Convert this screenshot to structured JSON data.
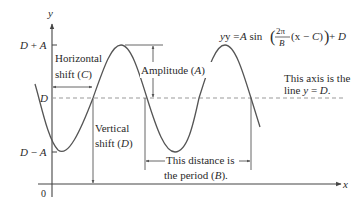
{
  "diagram": {
    "colors": {
      "curve": "#555555",
      "axis": "#444444",
      "dashed_midline": "#999999",
      "annotation": "#555555",
      "text": "#2a2a2a"
    },
    "axes": {
      "x_label": "x",
      "y_label": "y",
      "origin_label": "0"
    },
    "y_ticks": {
      "max_label_main": "D",
      "max_label_op": " + ",
      "max_label_var": "A",
      "mid_label": "D",
      "min_label_main": "D",
      "min_label_op": " − ",
      "min_label_var": "A"
    },
    "equation": {
      "lhs": "y = ",
      "amp": "A",
      "fn": " sin",
      "frac_num": "2π",
      "frac_den": "B",
      "arg_open": "(x − ",
      "arg_c": "C",
      "arg_close": ")",
      "plus": " + ",
      "d": "D"
    },
    "annotations": {
      "horizontal_shift_line1": "Horizontal",
      "horizontal_shift_line2_pre": "shift (",
      "horizontal_shift_var": "C",
      "horizontal_shift_line2_post": ")",
      "amplitude_pre": "Amplitude (",
      "amplitude_var": "A",
      "amplitude_post": ")",
      "vertical_shift_line1": "Vertical",
      "vertical_shift_line2_pre": "shift (",
      "vertical_shift_var": "D",
      "vertical_shift_line2_post": ")",
      "axis_note_line1": "This axis is the",
      "axis_note_line2_pre": "line ",
      "axis_note_line2_y": "y",
      "axis_note_line2_eq": " = ",
      "axis_note_line2_var": "D",
      "axis_note_line2_post": ".",
      "period_line1": "This distance is",
      "period_line2_pre": "the period (",
      "period_var": "B",
      "period_line2_post": ")."
    }
  }
}
